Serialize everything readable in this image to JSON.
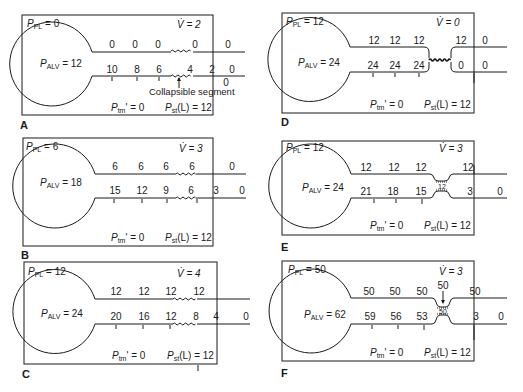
{
  "figure": {
    "colors": {
      "ink": "#1a1a1a",
      "background": "#ffffff"
    },
    "collapsible_annotation": "Collapsible segment",
    "panels": [
      {
        "id": "A",
        "letter": "A",
        "ppl_label": "P",
        "ppl_sub": "PL",
        "ppl_value": "= 0",
        "palv_label": "P",
        "palv_sub": "ALV",
        "palv_value": "= 12",
        "flow_label": "V̇ = 2",
        "ptm_label": "P",
        "ptm_sub": "tm",
        "ptm_value": "' = 0",
        "pst_label": "P",
        "pst_sub": "st",
        "pst_value": "(L) = 12",
        "outside_pressures": [
          "0",
          "0",
          "0",
          "0",
          "0"
        ],
        "inside_pressures": [
          "10",
          "8",
          "6",
          "4",
          "2",
          "0"
        ],
        "below_right": "0",
        "constriction": "none"
      },
      {
        "id": "B",
        "letter": "B",
        "ppl_label": "P",
        "ppl_sub": "PL",
        "ppl_value": "= 6",
        "palv_label": "P",
        "palv_sub": "ALV",
        "palv_value": "= 18",
        "flow_label": "V̇ = 3",
        "ptm_label": "P",
        "ptm_sub": "tm",
        "ptm_value": "' = 0",
        "pst_label": "P",
        "pst_sub": "st",
        "pst_value": "(L) = 12",
        "outside_pressures": [
          "6",
          "6",
          "6",
          "6",
          "0"
        ],
        "inside_pressures": [
          "15",
          "12",
          "9",
          "6",
          "3",
          "0"
        ],
        "constriction": "none"
      },
      {
        "id": "C",
        "letter": "C",
        "ppl_label": "P",
        "ppl_sub": "PL",
        "ppl_value": "= 12",
        "palv_label": "P",
        "palv_sub": "ALV",
        "palv_value": "= 24",
        "flow_label": "V̇ = 4",
        "ptm_label": "P",
        "ptm_sub": "tm",
        "ptm_value": "' = 0",
        "pst_label": "P",
        "pst_sub": "st",
        "pst_value": "(L) = 12",
        "outside_pressures": [
          "12",
          "12",
          "12",
          "12"
        ],
        "inside_pressures": [
          "20",
          "16",
          "12",
          "8",
          "4",
          "0"
        ],
        "constriction": "none"
      },
      {
        "id": "D",
        "letter": "D",
        "ppl_label": "P",
        "ppl_sub": "PL",
        "ppl_value": "= 12",
        "palv_label": "P",
        "palv_sub": "ALV",
        "palv_value": "= 24",
        "flow_label": "V̇ = 0",
        "ptm_label": "P",
        "ptm_sub": "tm",
        "ptm_value": "' = 0",
        "pst_label": "P",
        "pst_sub": "st",
        "pst_value": "(L) = 12",
        "outside_pressures": [
          "12",
          "12",
          "12",
          "12",
          "0"
        ],
        "inside_pressures": [
          "24",
          "24",
          "24",
          "0",
          "0"
        ],
        "constriction": "closed"
      },
      {
        "id": "E",
        "letter": "E",
        "ppl_label": "P",
        "ppl_sub": "PL",
        "ppl_value": "= 12",
        "palv_label": "P",
        "palv_sub": "ALV",
        "palv_value": "= 24",
        "flow_label": "V̇ = 3",
        "ptm_label": "P",
        "ptm_sub": "tm",
        "ptm_value": "' = 0",
        "pst_label": "P",
        "pst_sub": "st",
        "pst_value": "(L) = 12",
        "outside_pressures": [
          "12",
          "12",
          "12",
          "12"
        ],
        "inside_pressures": [
          "21",
          "18",
          "15",
          "3",
          "0"
        ],
        "constriction_value": "12",
        "constriction": "narrowed"
      },
      {
        "id": "F",
        "letter": "F",
        "ppl_label": "P",
        "ppl_sub": "PL",
        "ppl_value": "= 50",
        "palv_label": "P",
        "palv_sub": "ALV",
        "palv_value": "= 62",
        "flow_label": "V̇ = 3",
        "ptm_label": "P",
        "ptm_sub": "tm",
        "ptm_value": "' = 0",
        "pst_label": "P",
        "pst_sub": "st",
        "pst_value": "(L) = 12",
        "outside_pressures": [
          "50",
          "50",
          "50",
          "50",
          "50"
        ],
        "inside_pressures": [
          "59",
          "56",
          "53",
          "3",
          "0"
        ],
        "constriction_value": "50",
        "constriction": "narrowed"
      }
    ]
  }
}
